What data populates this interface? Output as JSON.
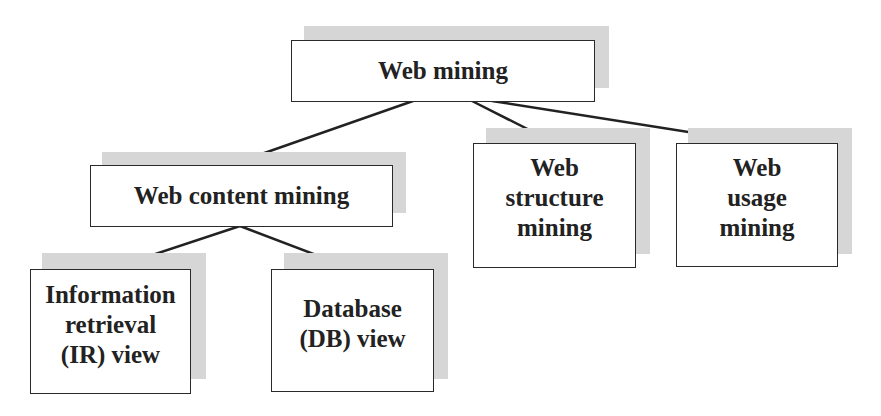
{
  "diagram": {
    "type": "tree",
    "colors": {
      "box_border": "#2a2a2a",
      "shadow": "#d6d6d6",
      "text": "#222222",
      "line": "#222222"
    },
    "nodes": [
      {
        "id": "web-mining",
        "label": "Web mining"
      },
      {
        "id": "web-content-mining",
        "label": "Web content mining"
      },
      {
        "id": "web-structure-mining",
        "label": "Web\nstructure\nmining"
      },
      {
        "id": "web-usage-mining",
        "label": "Web\nusage\nmining"
      },
      {
        "id": "ir-view",
        "label": "Information\nretrieval\n(IR) view"
      },
      {
        "id": "db-view",
        "label": "Database\n(DB) view"
      }
    ],
    "edges": [
      {
        "from": "web-mining",
        "to": "web-content-mining"
      },
      {
        "from": "web-mining",
        "to": "web-structure-mining"
      },
      {
        "from": "web-mining",
        "to": "web-usage-mining"
      },
      {
        "from": "web-content-mining",
        "to": "ir-view"
      },
      {
        "from": "web-content-mining",
        "to": "db-view"
      }
    ]
  }
}
